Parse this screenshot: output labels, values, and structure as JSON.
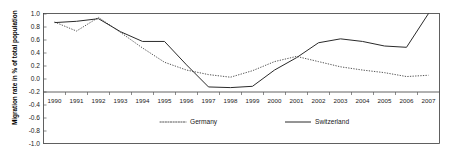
{
  "chart_data": {
    "type": "line",
    "title": "",
    "xlabel": "",
    "ylabel": "Migration rate in % of total population",
    "ylim": [
      -1.0,
      1.0
    ],
    "ytick_labels": [
      "1.0",
      "0.8",
      "0.6",
      "0.4",
      "0.2",
      "0.0",
      "-0.2",
      "-0.4",
      "-0.6",
      "-0.8",
      "-1.0"
    ],
    "ytick_values": [
      1.0,
      0.8,
      0.6,
      0.4,
      0.2,
      0.0,
      -0.2,
      -0.4,
      -0.6,
      -0.8,
      -1.0
    ],
    "grid": false,
    "legend_position": "inside-bottom-center",
    "categories": [
      "1990",
      "1991",
      "1992",
      "1993",
      "1994",
      "1995",
      "1996",
      "1997",
      "1998",
      "1999",
      "2000",
      "2001",
      "2002",
      "2003",
      "2004",
      "2005",
      "2006",
      "2007"
    ],
    "x": [
      1990,
      1991,
      1992,
      1993,
      1994,
      1995,
      1996,
      1997,
      1998,
      1999,
      2000,
      2001,
      2002,
      2003,
      2004,
      2005,
      2006,
      2007
    ],
    "series": [
      {
        "name": "Germany",
        "style": "dotted",
        "color": "#555555",
        "values": [
          0.87,
          0.73,
          0.94,
          0.71,
          0.47,
          0.25,
          0.13,
          0.06,
          0.02,
          0.12,
          0.26,
          0.34,
          0.26,
          0.18,
          0.13,
          0.09,
          0.03,
          0.05
        ]
      },
      {
        "name": "Switzerland",
        "style": "solid",
        "color": "#2a2a2a",
        "values": [
          0.86,
          0.88,
          0.92,
          0.72,
          0.57,
          0.57,
          0.21,
          -0.13,
          -0.14,
          -0.12,
          0.13,
          0.32,
          0.55,
          0.61,
          0.57,
          0.5,
          0.48,
          1.0
        ]
      }
    ],
    "annotations": []
  },
  "legend": {
    "items": [
      {
        "label": "Germany",
        "marker": "dotted-line-swatch"
      },
      {
        "label": "Switzerland",
        "marker": "solid-line-swatch"
      }
    ]
  },
  "colors": {
    "germany": "#555555",
    "switzerland": "#2a2a2a",
    "axis": "#3a3a3a",
    "background": "#ffffff"
  }
}
